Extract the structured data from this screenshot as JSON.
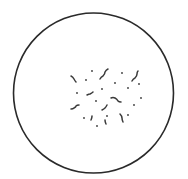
{
  "diagram": {
    "colors": {
      "background": "#ffffff",
      "outline": "#2a2a2a",
      "particles": "#3a3a3a"
    },
    "field": {
      "cx": 93.5,
      "cy": 93,
      "r": 80,
      "stroke_width": 1.6
    },
    "squiggles": [
      {
        "d": "M71,76 q2,1 3,3 q1,2 2,3"
      },
      {
        "d": "M100,79 q1,-2 3,-3 q2,-2 2,-4 q1,-2 3,-3"
      },
      {
        "d": "M132,81 q1,-2 3,-3 q2,-2 2,-4 q0,-2 1,-3"
      },
      {
        "d": "M87,95 q2,-1 3,-1 q2,-1 3,-2"
      },
      {
        "d": "M71,109 q2,0 3,-1 q2,-1 2,-2 q1,-1 3,-1"
      },
      {
        "d": "M111,98 q2,-1 4,0 q2,1 3,3 q1,1 3,1"
      },
      {
        "d": "M102,110 q2,-1 3,-2 q1,-1 2,-3"
      },
      {
        "d": "M92,116 q0,2 -1,4"
      },
      {
        "d": "M120,114 q2,2 2,4 q0,2 1,4"
      },
      {
        "d": "M105,120 q0,2 1,4"
      }
    ],
    "dots": [
      {
        "x": 92,
        "y": 71
      },
      {
        "x": 86,
        "y": 80
      },
      {
        "x": 122,
        "y": 73
      },
      {
        "x": 102,
        "y": 89
      },
      {
        "x": 77,
        "y": 93
      },
      {
        "x": 115,
        "y": 83
      },
      {
        "x": 128,
        "y": 88
      },
      {
        "x": 96,
        "y": 101
      },
      {
        "x": 141,
        "y": 98
      },
      {
        "x": 134,
        "y": 105
      },
      {
        "x": 84,
        "y": 118
      },
      {
        "x": 107,
        "y": 116
      },
      {
        "x": 128,
        "y": 115
      },
      {
        "x": 97,
        "y": 126
      },
      {
        "x": 139,
        "y": 84
      }
    ]
  }
}
